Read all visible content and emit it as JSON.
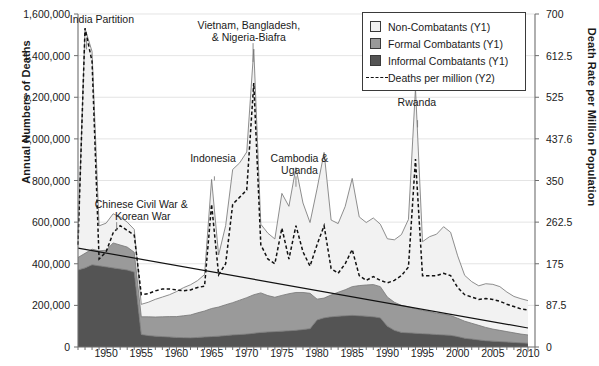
{
  "chart_data": {
    "type": "area",
    "title": "",
    "xlabel": "",
    "ylabel": "Annual Numbers of Deaths",
    "y2label": "Death Rate per Million Population",
    "xlim": [
      1946,
      2011
    ],
    "ylim": [
      0,
      1600000
    ],
    "y2lim": [
      0,
      700
    ],
    "grid": true,
    "legend_position": "top-right",
    "stacked": true,
    "xticks": [
      1950,
      1955,
      1960,
      1965,
      1970,
      1975,
      1980,
      1985,
      1990,
      1995,
      2000,
      2005,
      2010
    ],
    "xticks_minor_step": 1,
    "yticks": [
      "0",
      "200,000",
      "400,000",
      "600,000",
      "800,000",
      "1,000,000",
      "1,200,000",
      "1,400,000",
      "1,600,000"
    ],
    "yticks_values": [
      0,
      200000,
      400000,
      600000,
      800000,
      1000000,
      1200000,
      1400000,
      1600000
    ],
    "y2ticks": [
      "0",
      "87.5",
      "175",
      "262.5",
      "350",
      "437.6",
      "525",
      "612.5",
      "700"
    ],
    "y2ticks_values": [
      0,
      87.5,
      175,
      262.5,
      350,
      437.6,
      525,
      612.5,
      700
    ],
    "legend": [
      {
        "label": "Non-Combatants (Y1)",
        "marker": "swatch",
        "color": "#f2f2f2"
      },
      {
        "label": "Formal Combatants (Y1)",
        "marker": "swatch",
        "color": "#9a9a9a"
      },
      {
        "label": "Informal Combatants (Y1)",
        "marker": "swatch",
        "color": "#545454"
      },
      {
        "label": "Deaths per million (Y2)",
        "marker": "dashed-line",
        "color": "#111111"
      }
    ],
    "annotations": [
      {
        "text": "India Partition",
        "x": 1949.4,
        "y": 1545000,
        "leader_to_x": 1947.2,
        "leader_to_y": 1430000
      },
      {
        "text": "Chinese Civil War &\n Korean War",
        "x": 1955.0,
        "y": 660000,
        "leader_to_x": 1951.5,
        "leader_to_y": 560000
      },
      {
        "text": "Indonesia",
        "x": 1965.2,
        "y": 880000,
        "leader_to_x": 1965.4,
        "leader_to_y": 800000
      },
      {
        "text": "Vietnam, Bangladesh,\n& Nigeria-Biafra",
        "x": 1970.3,
        "y": 1520000,
        "leader_to_x": 1970.9,
        "leader_to_y": 1370000
      },
      {
        "text": "Cambodia &\nUganda",
        "x": 1977.5,
        "y": 880000,
        "leader_to_x": 1977.0,
        "leader_to_y": 770000
      },
      {
        "text": "Rwanda",
        "x": 1994.2,
        "y": 1150000,
        "leader_to_x": 1994.3,
        "leader_to_y": 1055000
      }
    ],
    "x": [
      1946,
      1947,
      1948,
      1949,
      1950,
      1951,
      1952,
      1953,
      1954,
      1955,
      1956,
      1957,
      1958,
      1959,
      1960,
      1961,
      1962,
      1963,
      1964,
      1965,
      1966,
      1967,
      1968,
      1969,
      1970,
      1971,
      1972,
      1973,
      1974,
      1975,
      1976,
      1977,
      1978,
      1979,
      1980,
      1981,
      1982,
      1983,
      1984,
      1985,
      1986,
      1987,
      1988,
      1989,
      1990,
      1991,
      1992,
      1993,
      1994,
      1995,
      1996,
      1997,
      1998,
      1999,
      2000,
      2001,
      2002,
      2003,
      2004,
      2005,
      2006,
      2007,
      2008,
      2009,
      2010
    ],
    "series": [
      {
        "name": "Informal Combatants (Y1)",
        "color": "#545454",
        "values": [
          370000,
          380000,
          395000,
          390000,
          385000,
          380000,
          375000,
          370000,
          360000,
          60000,
          55000,
          52000,
          50000,
          48000,
          46000,
          45000,
          44000,
          46000,
          48000,
          50000,
          52000,
          55000,
          58000,
          60000,
          62000,
          66000,
          70000,
          72000,
          74000,
          76000,
          78000,
          80000,
          84000,
          88000,
          130000,
          140000,
          145000,
          148000,
          150000,
          152000,
          150000,
          148000,
          145000,
          140000,
          100000,
          80000,
          70000,
          68000,
          66000,
          64000,
          62000,
          60000,
          58000,
          56000,
          50000,
          42000,
          38000,
          34000,
          30000,
          28000,
          26000,
          24000,
          22000,
          20000,
          18000
        ]
      },
      {
        "name": "Formal Combatants (Y1)",
        "color": "#9a9a9a",
        "values": [
          60000,
          70000,
          75000,
          72000,
          80000,
          120000,
          115000,
          110000,
          95000,
          85000,
          90000,
          92000,
          95000,
          98000,
          100000,
          105000,
          110000,
          118000,
          125000,
          135000,
          140000,
          148000,
          155000,
          165000,
          175000,
          185000,
          190000,
          175000,
          165000,
          172000,
          178000,
          182000,
          178000,
          170000,
          100000,
          95000,
          105000,
          115000,
          125000,
          138000,
          145000,
          150000,
          155000,
          150000,
          140000,
          135000,
          130000,
          125000,
          118000,
          112000,
          108000,
          102000,
          100000,
          95000,
          88000,
          82000,
          76000,
          70000,
          64000,
          58000,
          54000,
          50000,
          46000,
          42000,
          40000
        ]
      },
      {
        "name": "Non-Combatants (Y1)",
        "color": "#f2f2f2",
        "values": [
          100000,
          1080000,
          950000,
          120000,
          130000,
          140000,
          135000,
          120000,
          110000,
          60000,
          70000,
          85000,
          95000,
          105000,
          120000,
          135000,
          145000,
          155000,
          175000,
          620000,
          250000,
          380000,
          640000,
          660000,
          700000,
          1180000,
          330000,
          300000,
          280000,
          490000,
          420000,
          600000,
          430000,
          340000,
          530000,
          700000,
          360000,
          330000,
          400000,
          520000,
          330000,
          300000,
          320000,
          300000,
          280000,
          300000,
          340000,
          420000,
          1060000,
          330000,
          360000,
          380000,
          420000,
          400000,
          300000,
          220000,
          200000,
          190000,
          210000,
          215000,
          210000,
          190000,
          175000,
          170000,
          165000
        ]
      },
      {
        "name": "Deaths per million (Y2)",
        "color": "#111111",
        "axis": "y2",
        "values": [
          215,
          670,
          600,
          185,
          200,
          240,
          255,
          245,
          235,
          110,
          112,
          118,
          122,
          122,
          120,
          118,
          120,
          125,
          128,
          300,
          152,
          175,
          300,
          315,
          330,
          555,
          215,
          185,
          175,
          250,
          185,
          255,
          200,
          170,
          215,
          255,
          165,
          155,
          175,
          205,
          150,
          140,
          148,
          140,
          135,
          140,
          150,
          168,
          395,
          150,
          150,
          150,
          155,
          150,
          125,
          110,
          105,
          100,
          102,
          100,
          96,
          90,
          85,
          80,
          78
        ]
      },
      {
        "name": "Linear trend (Y2)",
        "color": "#111111",
        "axis": "y2",
        "trendline": true,
        "start": {
          "x": 1946,
          "y": 208
        },
        "end": {
          "x": 2010,
          "y": 40
        }
      }
    ]
  }
}
